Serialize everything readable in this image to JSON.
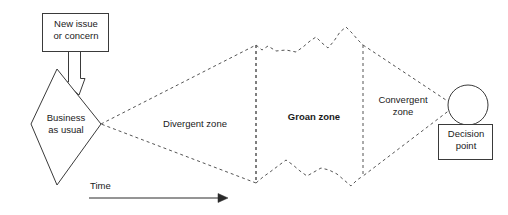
{
  "diagram": {
    "nodes": {
      "new_issue": {
        "label": "New issue\nor concern",
        "line1": "New issue",
        "line2": "or concern",
        "shape": "rectangle"
      },
      "business_as_usual": {
        "label": "Business as usual",
        "line1": "Business",
        "line2": "as usual",
        "shape": "diamond"
      },
      "decision_point": {
        "label": "Decision point",
        "line1": "Decision",
        "line2": "point",
        "shape": "rectangle"
      },
      "decision_circle": {
        "shape": "circle"
      }
    },
    "zones": [
      {
        "name": "divergent",
        "label": "Divergent zone",
        "bold": false
      },
      {
        "name": "groan",
        "label": "Groan zone",
        "bold": true
      },
      {
        "name": "convergent_line1",
        "label": "Convergent",
        "bold": false
      },
      {
        "name": "convergent_line2",
        "label": "zone",
        "bold": false
      }
    ],
    "axis": {
      "label": "Time",
      "direction": "left-to-right arrow"
    },
    "icons": {
      "down_arrow": "down-block-arrow-icon",
      "time_arrow": "right-arrow-icon"
    },
    "colors": {
      "stroke": "#3a3a3a",
      "text": "#1a1a1a",
      "background": "#ffffff"
    }
  }
}
